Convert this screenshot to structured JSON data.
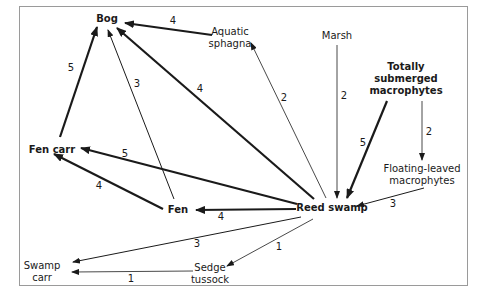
{
  "diagram": {
    "type": "succession-network",
    "nodes": [
      {
        "id": "bog",
        "label": "Bog",
        "bold": true,
        "x": 107,
        "y": 19
      },
      {
        "id": "aquatic_sphagna",
        "label": "Aquatic\nsphagna",
        "bold": false,
        "x": 230,
        "y": 38
      },
      {
        "id": "marsh",
        "label": "Marsh",
        "bold": false,
        "x": 337,
        "y": 36
      },
      {
        "id": "totally_submerged",
        "label": "Totally\nsubmerged\nmacrophytes",
        "bold": true,
        "x": 406,
        "y": 79
      },
      {
        "id": "fen_carr",
        "label": "Fen carr",
        "bold": true,
        "x": 52,
        "y": 150
      },
      {
        "id": "floating_leaved",
        "label": "Floating-leaved\nmacrophytes",
        "bold": false,
        "x": 422,
        "y": 175
      },
      {
        "id": "fen",
        "label": "Fen",
        "bold": true,
        "x": 178,
        "y": 210
      },
      {
        "id": "reed_swamp",
        "label": "Reed swamp",
        "bold": true,
        "x": 332,
        "y": 208
      },
      {
        "id": "swamp_carr",
        "label": "Swamp\ncarr",
        "bold": false,
        "x": 42,
        "y": 272
      },
      {
        "id": "sedge_tussock",
        "label": "Sedge\ntussock",
        "bold": false,
        "x": 210,
        "y": 274
      }
    ],
    "edges": [
      {
        "from": "aquatic_sphagna",
        "to": "bog",
        "weight": 4,
        "x1": 212,
        "y1": 35,
        "x2": 125,
        "y2": 23,
        "lx": 173,
        "ly": 21
      },
      {
        "from": "fen_carr",
        "to": "bog",
        "weight": 5,
        "x1": 60,
        "y1": 137,
        "x2": 97,
        "y2": 27,
        "lx": 71,
        "ly": 68
      },
      {
        "from": "fen",
        "to": "bog",
        "weight": 3,
        "x1": 174,
        "y1": 199,
        "x2": 108,
        "y2": 30,
        "lx": 137,
        "ly": 84
      },
      {
        "from": "reed_swamp",
        "to": "bog",
        "weight": 4,
        "x1": 314,
        "y1": 199,
        "x2": 117,
        "y2": 28,
        "lx": 200,
        "ly": 89
      },
      {
        "from": "reed_swamp",
        "to": "aquatic_sphagna",
        "weight": 2,
        "x1": 326,
        "y1": 198,
        "x2": 251,
        "y2": 43,
        "lx": 284,
        "ly": 98
      },
      {
        "from": "marsh",
        "to": "reed_swamp",
        "weight": 2,
        "x1": 337,
        "y1": 45,
        "x2": 337,
        "y2": 198,
        "lx": 344,
        "ly": 96
      },
      {
        "from": "totally_submerged",
        "to": "reed_swamp",
        "weight": 5,
        "x1": 387,
        "y1": 101,
        "x2": 347,
        "y2": 198,
        "lx": 363,
        "ly": 143
      },
      {
        "from": "totally_submerged",
        "to": "floating_leaved",
        "weight": 2,
        "x1": 422,
        "y1": 101,
        "x2": 422,
        "y2": 160,
        "lx": 429,
        "ly": 132
      },
      {
        "from": "floating_leaved",
        "to": "reed_swamp",
        "weight": 3,
        "x1": 424,
        "y1": 188,
        "x2": 357,
        "y2": 206,
        "lx": 393,
        "ly": 204
      },
      {
        "from": "reed_swamp",
        "to": "fen_carr",
        "weight": 5,
        "x1": 297,
        "y1": 204,
        "x2": 81,
        "y2": 148,
        "lx": 125,
        "ly": 154
      },
      {
        "from": "fen",
        "to": "fen_carr",
        "weight": 4,
        "x1": 163,
        "y1": 209,
        "x2": 54,
        "y2": 154,
        "lx": 99,
        "ly": 186
      },
      {
        "from": "reed_swamp",
        "to": "fen",
        "weight": 4,
        "x1": 296,
        "y1": 209,
        "x2": 196,
        "y2": 210,
        "lx": 221,
        "ly": 217
      },
      {
        "from": "reed_swamp",
        "to": "swamp_carr",
        "weight": 3,
        "x1": 301,
        "y1": 217,
        "x2": 73,
        "y2": 262,
        "lx": 197,
        "ly": 244
      },
      {
        "from": "reed_swamp",
        "to": "sedge_tussock",
        "weight": 1,
        "x1": 313,
        "y1": 219,
        "x2": 227,
        "y2": 266,
        "lx": 279,
        "ly": 247
      },
      {
        "from": "sedge_tussock",
        "to": "swamp_carr",
        "weight": 1,
        "x1": 193,
        "y1": 271,
        "x2": 72,
        "y2": 272,
        "lx": 131,
        "ly": 279
      }
    ]
  }
}
